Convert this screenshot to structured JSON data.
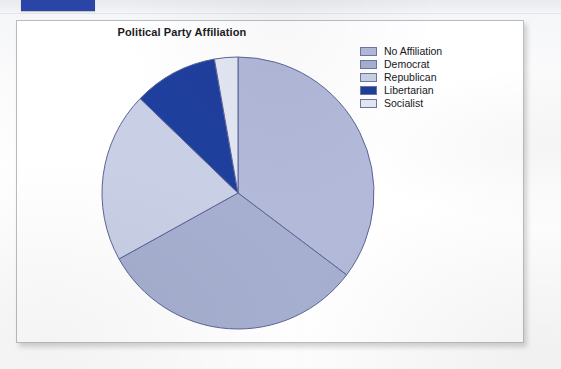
{
  "document": {
    "background_color": "#fbfbfc",
    "top_bar": {
      "accent_color": "#2a44a8",
      "strip_color": "#eef0f3"
    }
  },
  "panel": {
    "background_color": "#ffffff",
    "border_color": "#b9bcc2"
  },
  "chart_data": {
    "type": "pie",
    "title": "Political Party Affiliation",
    "xlabel": "",
    "ylabel": "",
    "legend_position": "right",
    "grid": false,
    "start_angle_deg": 0,
    "direction": "clockwise",
    "categories": [
      "No Affiliation",
      "Democrat",
      "Republican",
      "Libertarian",
      "Socialist"
    ],
    "values": [
      35.3,
      31.7,
      20.3,
      10.0,
      2.7
    ],
    "units": "percent",
    "colors": [
      "#b2b9d9",
      "#a7afd0",
      "#c9cfe5",
      "#1f3f9e",
      "#e3e7f3"
    ],
    "slice_border_color": "#5b6496",
    "slices": [
      {
        "label": "No Affiliation",
        "value": 35.3,
        "color": "#b2b9d9",
        "start_deg": 0,
        "end_deg": 127
      },
      {
        "label": "Democrat",
        "value": 31.7,
        "color": "#a7afd0",
        "start_deg": 127,
        "end_deg": 241
      },
      {
        "label": "Republican",
        "value": 20.3,
        "color": "#c9cfe5",
        "start_deg": 241,
        "end_deg": 314
      },
      {
        "label": "Libertarian",
        "value": 10.0,
        "color": "#1f3f9e",
        "start_deg": 314,
        "end_deg": 350
      },
      {
        "label": "Socialist",
        "value": 2.7,
        "color": "#e3e7f3",
        "start_deg": 350,
        "end_deg": 360
      }
    ]
  },
  "legend": {
    "items": [
      {
        "label": "No Affiliation",
        "color": "#b2b9d9"
      },
      {
        "label": "Democrat",
        "color": "#a7afd0"
      },
      {
        "label": "Republican",
        "color": "#c9cfe5"
      },
      {
        "label": "Libertarian",
        "color": "#1f3f9e"
      },
      {
        "label": "Socialist",
        "color": "#e3e7f3"
      }
    ]
  }
}
